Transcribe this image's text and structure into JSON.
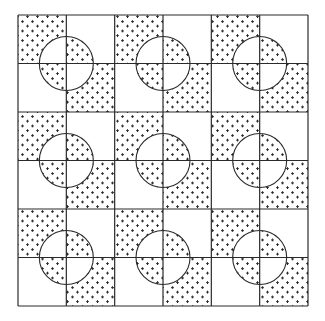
{
  "figure": {
    "title": "Checkerboard pattern with circles inverting dotted quadrants",
    "grid": {
      "rows": 6,
      "cols": 6,
      "x0": 18,
      "y0": 15,
      "width": 290,
      "height": 291
    },
    "block_pattern": {
      "description": "Each 2x2 block: top-left and bottom-right cells dotted, top-right and bottom-left blank; a circle centered at the block's center inverts the fill within it",
      "dotted_cells": [
        [
          0,
          0
        ],
        [
          1,
          1
        ]
      ],
      "circle_radius": 27
    },
    "blocks": 9,
    "colors": {
      "line": "#2a2a2a",
      "dot": "#2a2a2a",
      "background": "#ffffff"
    },
    "dot_symbol": "+"
  }
}
